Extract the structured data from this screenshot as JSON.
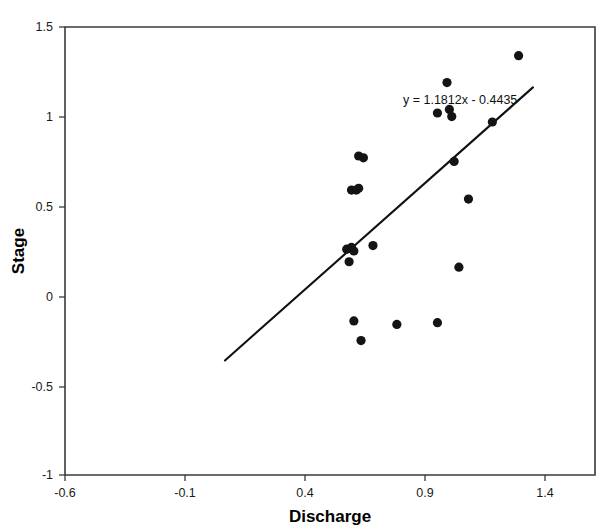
{
  "chart_data": {
    "type": "scatter",
    "title": "",
    "xlabel": "Discharge",
    "ylabel": "Stage",
    "xlim": [
      -0.6,
      1.62
    ],
    "ylim": [
      -1,
      1.5
    ],
    "xticks": [
      -0.6,
      -0.1,
      0.4,
      0.9,
      1.4
    ],
    "xtick_labels": [
      "-0.6",
      "-0.1",
      "0.4",
      "0.9",
      "1.4"
    ],
    "yticks": [
      -1,
      -0.5,
      0,
      0.5,
      1,
      1.5
    ],
    "ytick_labels": [
      "-1",
      "-0.5",
      "0",
      "0.5",
      "1",
      "1.5"
    ],
    "grid": false,
    "legend": false,
    "marker": "filled-circle",
    "marker_color": "#141414",
    "points": [
      {
        "x": 0.58,
        "y": 0.26
      },
      {
        "x": 0.6,
        "y": 0.27
      },
      {
        "x": 0.61,
        "y": 0.25
      },
      {
        "x": 0.69,
        "y": 0.28
      },
      {
        "x": 0.59,
        "y": 0.19
      },
      {
        "x": 0.6,
        "y": 0.59
      },
      {
        "x": 0.62,
        "y": 0.59
      },
      {
        "x": 0.63,
        "y": 0.6
      },
      {
        "x": 0.63,
        "y": 0.78
      },
      {
        "x": 0.65,
        "y": 0.77
      },
      {
        "x": 0.61,
        "y": -0.14
      },
      {
        "x": 0.64,
        "y": -0.25
      },
      {
        "x": 0.79,
        "y": -0.16
      },
      {
        "x": 0.96,
        "y": -0.15
      },
      {
        "x": 0.96,
        "y": 1.02
      },
      {
        "x": 1.01,
        "y": 1.04
      },
      {
        "x": 1.02,
        "y": 1.0
      },
      {
        "x": 1.0,
        "y": 1.19
      },
      {
        "x": 1.03,
        "y": 0.75
      },
      {
        "x": 1.05,
        "y": 0.16
      },
      {
        "x": 1.09,
        "y": 0.54
      },
      {
        "x": 1.19,
        "y": 0.97
      },
      {
        "x": 1.3,
        "y": 1.34
      }
    ],
    "trendline": {
      "equation_label": "y = 1.1812x - 0.4435",
      "slope": 1.1812,
      "intercept": -0.4435,
      "x_start": 0.07,
      "x_end": 1.36
    }
  }
}
